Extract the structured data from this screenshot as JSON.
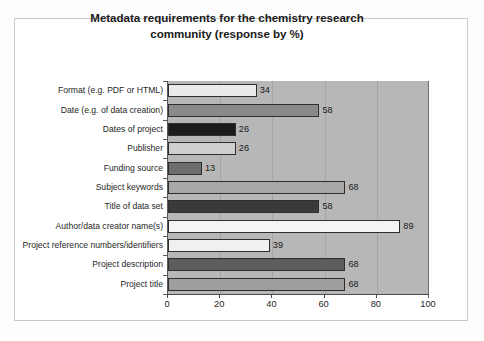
{
  "chart_data": {
    "type": "bar",
    "orientation": "horizontal",
    "title": "Metadata requirements for the chemistry research community (response by %)",
    "title_lines": [
      "Metadata requirements for the chemistry research",
      "community (response by %)"
    ],
    "xlabel": "",
    "ylabel": "",
    "xlim": [
      0,
      100
    ],
    "xticks": [
      0,
      20,
      40,
      60,
      80,
      100
    ],
    "xtick_labels": [
      "0",
      "20",
      "40",
      "60",
      "80",
      "100"
    ],
    "grid": "vertical",
    "legend": "none",
    "categories": [
      "Format (e.g. PDF or HTML)",
      "Date (e.g. of data creation)",
      "Dates of project",
      "Publisher",
      "Funding source",
      "Subject keywords",
      "Title of data set",
      "Author/data creator name(s)",
      "Project reference numbers/identifiers",
      "Project description",
      "Project title"
    ],
    "values": [
      34,
      58,
      26,
      26,
      13,
      68,
      58,
      89,
      39,
      68,
      68
    ],
    "value_labels": [
      "34",
      "58",
      "26",
      "26",
      "13",
      "68",
      "58",
      "89",
      "39",
      "68",
      "68"
    ],
    "bar_colors": [
      "#ebebeb",
      "#8a8a8a",
      "#1c1c1c",
      "#cfcfcf",
      "#6e6e6e",
      "#a8a8a8",
      "#3a3a3a",
      "#f4f4f4",
      "#f0f0f0",
      "#5d5d5d",
      "#9e9e9e"
    ],
    "plot_background": "#b7b7b7",
    "bar_border_color": "#2e2e2e"
  }
}
